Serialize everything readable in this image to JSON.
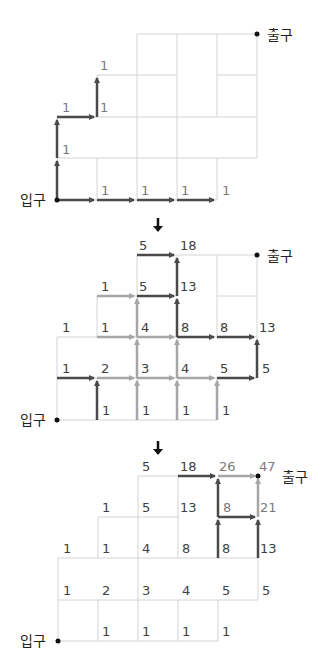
{
  "labels": {
    "entrance": "입구",
    "exit": "출구"
  },
  "colors": {
    "grid": "#d4d4d4",
    "arrow_dark": "#4a4a4a",
    "arrow_light": "#a6a6a6",
    "text": "#404040",
    "text_light": "#7a7a7a"
  },
  "transition_icon": "down-arrow-icon",
  "diagrams": [
    {
      "name": "step-1-initial-paths",
      "numbers": [
        {
          "id": "d1_n1",
          "text": "1",
          "x": 100,
          "y": 70
        },
        {
          "id": "d1_n2",
          "text": "1",
          "x": 62,
          "y": 112
        },
        {
          "id": "d1_n3",
          "text": "1",
          "x": 100,
          "y": 112
        },
        {
          "id": "d1_n4",
          "text": "1",
          "x": 62,
          "y": 154
        },
        {
          "id": "d1_n5",
          "text": "1",
          "x": 101,
          "y": 195
        },
        {
          "id": "d1_n6",
          "text": "1",
          "x": 141,
          "y": 195
        },
        {
          "id": "d1_n7",
          "text": "1",
          "x": 181,
          "y": 195
        },
        {
          "id": "d1_n8",
          "text": "1",
          "x": 222,
          "y": 195
        }
      ]
    },
    {
      "name": "step-2-accumulated-counts",
      "numbers": [
        {
          "id": "d2_n1",
          "text": "5",
          "x": 139,
          "y": 250
        },
        {
          "id": "d2_n2",
          "text": "18",
          "x": 180,
          "y": 250
        },
        {
          "id": "d2_n3",
          "text": "1",
          "x": 101,
          "y": 291
        },
        {
          "id": "d2_n4",
          "text": "5",
          "x": 139,
          "y": 291
        },
        {
          "id": "d2_n5",
          "text": "13",
          "x": 180,
          "y": 291
        },
        {
          "id": "d2_n6",
          "text": "1",
          "x": 62,
          "y": 332
        },
        {
          "id": "d2_n7",
          "text": "1",
          "x": 101,
          "y": 332
        },
        {
          "id": "d2_n8",
          "text": "4",
          "x": 141,
          "y": 332
        },
        {
          "id": "d2_n9",
          "text": "8",
          "x": 181,
          "y": 332
        },
        {
          "id": "d2_n10",
          "text": "8",
          "x": 220,
          "y": 332
        },
        {
          "id": "d2_n11",
          "text": "13",
          "x": 259,
          "y": 332
        },
        {
          "id": "d2_n12",
          "text": "1",
          "x": 62,
          "y": 373
        },
        {
          "id": "d2_n13",
          "text": "2",
          "x": 101,
          "y": 373
        },
        {
          "id": "d2_n14",
          "text": "3",
          "x": 141,
          "y": 373
        },
        {
          "id": "d2_n15",
          "text": "4",
          "x": 181,
          "y": 373
        },
        {
          "id": "d2_n16",
          "text": "5",
          "x": 220,
          "y": 373
        },
        {
          "id": "d2_n17",
          "text": "5",
          "x": 262,
          "y": 373
        },
        {
          "id": "d2_n18",
          "text": "1",
          "x": 102,
          "y": 415
        },
        {
          "id": "d2_n19",
          "text": "1",
          "x": 142,
          "y": 415
        },
        {
          "id": "d2_n20",
          "text": "1",
          "x": 182,
          "y": 415
        },
        {
          "id": "d2_n21",
          "text": "1",
          "x": 222,
          "y": 415
        }
      ]
    },
    {
      "name": "step-3-final-count",
      "result": "47",
      "numbers": [
        {
          "id": "d3_n1",
          "text": "5",
          "x": 142,
          "y": 471,
          "c": "dark"
        },
        {
          "id": "d3_n2",
          "text": "18",
          "x": 180,
          "y": 471,
          "c": "dark"
        },
        {
          "id": "d3_n3",
          "text": "26",
          "x": 219,
          "y": 471,
          "c": "gray"
        },
        {
          "id": "d3_n4",
          "text": "47",
          "x": 259,
          "y": 471,
          "c": "gray"
        },
        {
          "id": "d3_n5",
          "text": "1",
          "x": 102,
          "y": 512,
          "c": "dark"
        },
        {
          "id": "d3_n6",
          "text": "5",
          "x": 142,
          "y": 512,
          "c": "dark"
        },
        {
          "id": "d3_n7",
          "text": "13",
          "x": 180,
          "y": 512,
          "c": "dark"
        },
        {
          "id": "d3_n8",
          "text": "8",
          "x": 223,
          "y": 512,
          "c": "gray"
        },
        {
          "id": "d3_n9",
          "text": "21",
          "x": 260,
          "y": 512,
          "c": "gray"
        },
        {
          "id": "d3_n10",
          "text": "1",
          "x": 63,
          "y": 553,
          "c": "dark"
        },
        {
          "id": "d3_n11",
          "text": "1",
          "x": 102,
          "y": 553,
          "c": "dark"
        },
        {
          "id": "d3_n12",
          "text": "4",
          "x": 142,
          "y": 553,
          "c": "dark"
        },
        {
          "id": "d3_n13",
          "text": "8",
          "x": 182,
          "y": 553,
          "c": "dark"
        },
        {
          "id": "d3_n14",
          "text": "8",
          "x": 222,
          "y": 553,
          "c": "dark"
        },
        {
          "id": "d3_n15",
          "text": "13",
          "x": 260,
          "y": 553,
          "c": "dark"
        },
        {
          "id": "d3_n16",
          "text": "1",
          "x": 63,
          "y": 595,
          "c": "dark"
        },
        {
          "id": "d3_n17",
          "text": "2",
          "x": 102,
          "y": 595,
          "c": "dark"
        },
        {
          "id": "d3_n18",
          "text": "3",
          "x": 142,
          "y": 595,
          "c": "dark"
        },
        {
          "id": "d3_n19",
          "text": "4",
          "x": 182,
          "y": 595,
          "c": "dark"
        },
        {
          "id": "d3_n20",
          "text": "5",
          "x": 222,
          "y": 595,
          "c": "dark"
        },
        {
          "id": "d3_n21",
          "text": "5",
          "x": 262,
          "y": 595,
          "c": "dark"
        },
        {
          "id": "d3_n22",
          "text": "1",
          "x": 102,
          "y": 636,
          "c": "dark"
        },
        {
          "id": "d3_n23",
          "text": "1",
          "x": 142,
          "y": 636,
          "c": "dark"
        },
        {
          "id": "d3_n24",
          "text": "1",
          "x": 182,
          "y": 636,
          "c": "dark"
        },
        {
          "id": "d3_n25",
          "text": "1",
          "x": 222,
          "y": 636,
          "c": "dark"
        }
      ]
    }
  ]
}
